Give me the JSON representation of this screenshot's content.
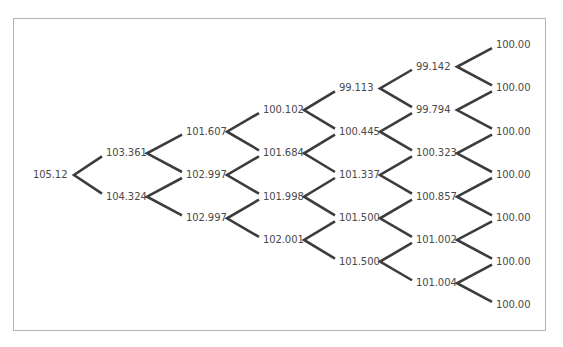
{
  "diagram": {
    "type": "binomial-tree",
    "line_color": "#3c3c3c",
    "text_color": "#4a4a4a",
    "border_color": "#b4b4b4",
    "levels": [
      [
        "105.12"
      ],
      [
        "103.361",
        "104.324"
      ],
      [
        "101.607",
        "102.997",
        "102.997"
      ],
      [
        "100.102",
        "101.684",
        "101.998",
        "102.001"
      ],
      [
        "99.113",
        "100.445",
        "101.337",
        "101.500",
        "101.500"
      ],
      [
        "99.142",
        "99.794",
        "100.323",
        "100.857",
        "101.002",
        "101.004"
      ],
      [
        "100.00",
        "100.00",
        "100.00",
        "100.00",
        "100.00",
        "100.00",
        "100.00"
      ]
    ]
  }
}
